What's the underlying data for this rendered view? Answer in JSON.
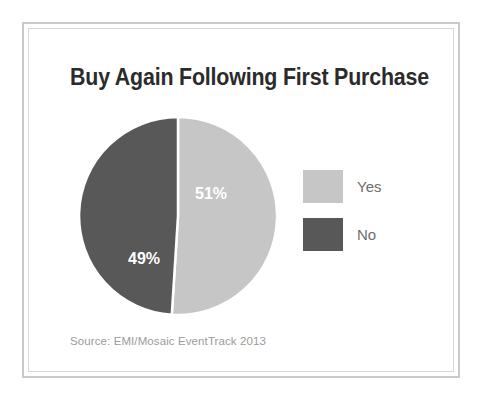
{
  "figure": {
    "title": "Buy Again Following First Purchase",
    "source_note": "Source: EMI/Mosaic EventTrack 2013"
  },
  "legend": {
    "items": [
      {
        "label": "Yes",
        "color": "#c6c6c6"
      },
      {
        "label": "No",
        "color": "#585858"
      }
    ]
  },
  "colors": {
    "yes": "#c6c6c6",
    "no": "#585858",
    "title_text": "#2b2b2b",
    "legend_text": "#6e6e6e",
    "source_text": "#9b9b9b",
    "frame_outer": "#c9c9c9",
    "frame_inner": "#d8d8d8",
    "slice_label_text": "#ffffff",
    "separator": "#ffffff",
    "background": "#ffffff"
  },
  "chart_data": {
    "type": "pie",
    "title": "Buy Again Following First Purchase",
    "subtitle": "",
    "xlabel": "",
    "ylabel": "",
    "categories": [
      "Yes",
      "No"
    ],
    "values": [
      51,
      49
    ],
    "value_unit": "%",
    "data_labels": [
      "51%",
      "49%"
    ],
    "slice_colors": [
      "#c6c6c6",
      "#585858"
    ],
    "start_angle_deg": 0,
    "direction": "clockwise",
    "grid": false,
    "legend_position": "right",
    "annotations": [
      "Source: EMI/Mosaic EventTrack 2013"
    ],
    "series": [
      {
        "name": "Buy Again Following First Purchase",
        "points": [
          {
            "category": "Yes",
            "value": 51,
            "label": "51%",
            "color": "#c6c6c6"
          },
          {
            "category": "No",
            "value": 49,
            "label": "49%",
            "color": "#585858"
          }
        ]
      }
    ]
  }
}
